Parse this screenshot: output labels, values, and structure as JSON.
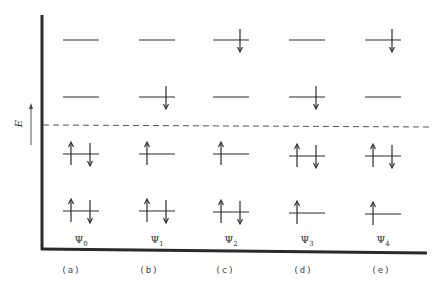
{
  "figure": {
    "axis_label": "E",
    "axis_arrow_direction": "up",
    "fermi_line": "dashed",
    "columns": [
      {
        "state": "Ψ",
        "state_sub": "0",
        "panel": "(a)",
        "x": 81,
        "levels": [
          {
            "y": 40,
            "electrons": []
          },
          {
            "y": 97,
            "electrons": []
          },
          {
            "y": 154,
            "electrons": [
              "up",
              "down"
            ]
          },
          {
            "y": 211,
            "electrons": [
              "up",
              "down"
            ]
          }
        ]
      },
      {
        "state": "Ψ",
        "state_sub": "1",
        "panel": "(b)",
        "x": 157,
        "levels": [
          {
            "y": 40,
            "electrons": []
          },
          {
            "y": 97,
            "electrons": [
              "down"
            ]
          },
          {
            "y": 154,
            "electrons": [
              "up"
            ]
          },
          {
            "y": 211,
            "electrons": [
              "up",
              "down"
            ]
          }
        ]
      },
      {
        "state": "Ψ",
        "state_sub": "2",
        "panel": "(c)",
        "x": 231,
        "levels": [
          {
            "y": 40,
            "electrons": [
              "down"
            ]
          },
          {
            "y": 97,
            "electrons": []
          },
          {
            "y": 154,
            "electrons": [
              "up"
            ]
          },
          {
            "y": 212,
            "electrons": [
              "up",
              "down"
            ]
          }
        ]
      },
      {
        "state": "Ψ",
        "state_sub": "3",
        "panel": "(d)",
        "x": 307,
        "levels": [
          {
            "y": 40,
            "electrons": []
          },
          {
            "y": 97,
            "electrons": [
              "down"
            ]
          },
          {
            "y": 156,
            "electrons": [
              "up",
              "down"
            ]
          },
          {
            "y": 213,
            "electrons": [
              "up"
            ]
          }
        ]
      },
      {
        "state": "Ψ",
        "state_sub": "4",
        "panel": "(e)",
        "x": 383,
        "levels": [
          {
            "y": 40,
            "electrons": [
              "down"
            ]
          },
          {
            "y": 97,
            "electrons": []
          },
          {
            "y": 156,
            "electrons": [
              "up",
              "down"
            ]
          },
          {
            "y": 214,
            "electrons": [
              "up"
            ]
          }
        ]
      }
    ],
    "colors": {
      "ink": "#2a2a2a",
      "background": "#ffffff"
    }
  }
}
